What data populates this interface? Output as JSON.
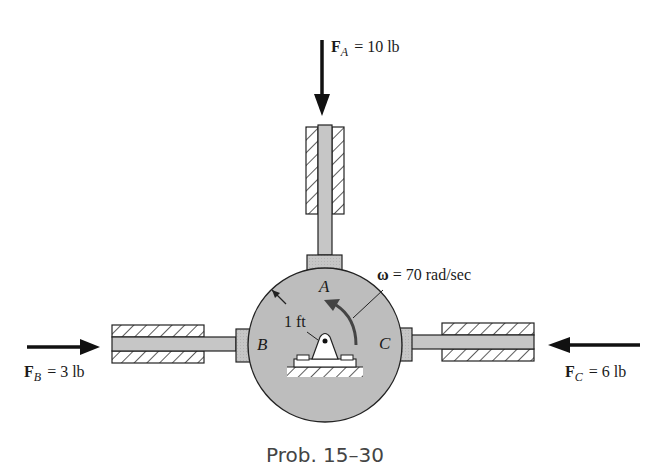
{
  "figure": {
    "caption": "Prob. 15–30",
    "colors": {
      "disk_fill": "#bdbdbd",
      "rod_fill": "#c9c9c9",
      "line": "#222222",
      "hatch": "#333333"
    }
  },
  "forces": {
    "A": {
      "symbol": "F",
      "subscript": "A",
      "eq": "= 10 lb",
      "direction": "down"
    },
    "B": {
      "symbol": "F",
      "subscript": "B",
      "eq": "= 3 lb",
      "direction": "right"
    },
    "C": {
      "symbol": "F",
      "subscript": "C",
      "eq": "= 6 lb",
      "direction": "left"
    }
  },
  "points": {
    "A": "A",
    "B": "B",
    "C": "C"
  },
  "radius_label": "1 ft",
  "omega": {
    "symbol": "ω",
    "eq": "= 70 rad/sec"
  }
}
